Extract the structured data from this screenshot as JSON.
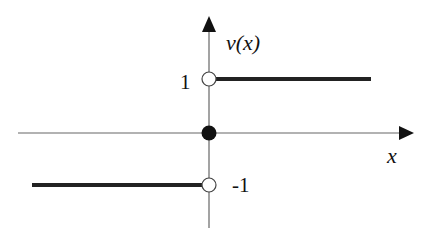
{
  "diagram": {
    "x_axis_label": "x",
    "y_axis_label": "v(x)",
    "level_labels": {
      "upper": "1",
      "lower": "-1"
    },
    "segments": [
      {
        "name": "upper-branch",
        "domain": "x > 0",
        "value": 1
      },
      {
        "name": "lower-branch",
        "domain": "x < 0",
        "value": -1
      }
    ],
    "points": [
      {
        "name": "open-point-upper",
        "x": 0,
        "y": 1,
        "filled": false
      },
      {
        "name": "filled-point-origin",
        "x": 0,
        "y": 0,
        "filled": true
      },
      {
        "name": "open-point-lower",
        "x": 0,
        "y": -1,
        "filled": false
      }
    ],
    "colors": {
      "axis": "#555555",
      "line": "#222222",
      "point_fill": "#111111"
    }
  }
}
